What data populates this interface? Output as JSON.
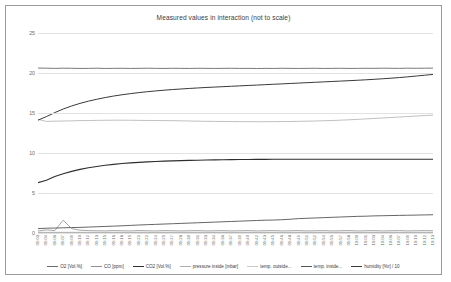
{
  "chart_data": {
    "type": "line",
    "title": "Measured values in interaction (not to scale)",
    "xlabel": "",
    "ylabel": "",
    "ylim": [
      0,
      25
    ],
    "yticks": [
      0,
      5,
      10,
      15,
      20,
      25
    ],
    "grid": true,
    "legend_position": "bottom",
    "x": [
      "09:03",
      "09:04",
      "09:06",
      "09:07",
      "09:09",
      "09:10",
      "09:12",
      "09:13",
      "09:15",
      "09:16",
      "09:18",
      "09:19",
      "09:21",
      "09:22",
      "09:24",
      "09:25",
      "09:27",
      "09:28",
      "09:30",
      "09:31",
      "09:33",
      "09:34",
      "09:36",
      "09:37",
      "09:39",
      "09:40",
      "09:42",
      "09:43",
      "09:45",
      "09:46",
      "09:48",
      "09:49",
      "09:51",
      "09:52",
      "09:54",
      "09:55",
      "09:57",
      "09:58",
      "10:00",
      "10:01",
      "10:03",
      "10:04",
      "10:06",
      "10:07",
      "10:09",
      "10:10",
      "10:12",
      "10:13"
    ],
    "series": [
      {
        "name": "O2 [Vol.%]",
        "color": "#6b6b6b",
        "width": 0.9,
        "values": [
          20.62,
          20.6,
          20.58,
          20.6,
          20.59,
          20.57,
          20.58,
          20.6,
          20.57,
          20.58,
          20.59,
          20.57,
          20.58,
          20.6,
          20.58,
          20.57,
          20.59,
          20.58,
          20.57,
          20.59,
          20.58,
          20.57,
          20.58,
          20.59,
          20.57,
          20.58,
          20.56,
          20.58,
          20.57,
          20.59,
          20.58,
          20.57,
          20.58,
          20.59,
          20.57,
          20.58,
          20.59,
          20.57,
          20.58,
          20.59,
          20.58,
          20.6,
          20.59,
          20.58,
          20.6,
          20.59,
          20.6,
          20.61
        ]
      },
      {
        "name": "CO [ppm]",
        "color": "#8f8f8f",
        "width": 0.8,
        "values": [
          0.25,
          0.4,
          0.3,
          1.6,
          0.55,
          0.35,
          0.3,
          0.28,
          0.26,
          0.3,
          0.28,
          0.26,
          0.3,
          0.28,
          0.26,
          0.3,
          0.28,
          0.26,
          0.28,
          0.3,
          0.26,
          0.28,
          0.3,
          0.26,
          0.28,
          0.3,
          0.26,
          0.28,
          0.3,
          0.26,
          0.28,
          0.3,
          0.26,
          0.28,
          0.3,
          0.26,
          0.28,
          0.3,
          0.26,
          0.28,
          0.3,
          0.26,
          0.28,
          0.3,
          0.26,
          0.28,
          0.3,
          0.28
        ]
      },
      {
        "name": "CO2 [Vol.%]",
        "color": "#2e2e2e",
        "width": 1.1,
        "values": [
          6.3,
          6.6,
          7.05,
          7.4,
          7.7,
          7.95,
          8.15,
          8.32,
          8.46,
          8.58,
          8.68,
          8.76,
          8.83,
          8.89,
          8.94,
          8.98,
          9.02,
          9.05,
          9.08,
          9.1,
          9.12,
          9.14,
          9.15,
          9.17,
          9.18,
          9.19,
          9.2,
          9.2,
          9.21,
          9.21,
          9.22,
          9.22,
          9.22,
          9.22,
          9.22,
          9.22,
          9.22,
          9.22,
          9.22,
          9.22,
          9.22,
          9.22,
          9.22,
          9.22,
          9.22,
          9.22,
          9.22,
          9.22
        ]
      },
      {
        "name": "pressure inside [mbar]",
        "color": "#b0b0b0",
        "width": 0.8,
        "values": [
          14.2,
          13.95,
          13.98,
          14.0,
          14.02,
          14.05,
          14.06,
          14.08,
          14.09,
          14.1,
          14.1,
          14.09,
          14.08,
          14.07,
          14.06,
          14.05,
          14.04,
          14.02,
          14.0,
          13.98,
          13.96,
          13.95,
          13.94,
          13.93,
          13.92,
          13.92,
          13.91,
          13.91,
          13.92,
          13.93,
          13.94,
          13.96,
          13.98,
          14.0,
          14.03,
          14.06,
          14.1,
          14.15,
          14.2,
          14.26,
          14.32,
          14.38,
          14.44,
          14.5,
          14.56,
          14.62,
          14.68,
          14.74
        ]
      },
      {
        "name": "temp. outside...",
        "color": "#c9c9c9",
        "width": 0.8,
        "values": [
          0.1,
          0.1,
          0.1,
          0.1,
          0.1,
          0.1,
          0.1,
          0.1,
          0.1,
          0.1,
          0.1,
          0.1,
          0.1,
          0.1,
          0.1,
          0.1,
          0.1,
          0.1,
          0.1,
          0.1,
          0.1,
          0.1,
          0.1,
          0.1,
          0.1,
          0.1,
          0.1,
          0.1,
          0.1,
          0.1,
          0.1,
          0.1,
          0.1,
          0.1,
          0.1,
          0.1,
          0.1,
          0.1,
          0.1,
          0.1,
          0.1,
          0.1,
          0.1,
          0.1,
          0.1,
          0.1,
          0.1,
          0.1
        ]
      },
      {
        "name": "temp. inside...",
        "color": "#555555",
        "width": 0.9,
        "values": [
          0.55,
          0.6,
          0.62,
          0.65,
          0.68,
          0.7,
          0.74,
          0.78,
          0.82,
          0.86,
          0.9,
          0.95,
          1.0,
          1.04,
          1.08,
          1.12,
          1.16,
          1.2,
          1.24,
          1.28,
          1.32,
          1.36,
          1.4,
          1.44,
          1.48,
          1.52,
          1.56,
          1.6,
          1.62,
          1.66,
          1.72,
          1.8,
          1.84,
          1.88,
          1.92,
          1.96,
          2.0,
          2.04,
          2.08,
          2.1,
          2.14,
          2.16,
          2.18,
          2.2,
          2.22,
          2.24,
          2.26,
          2.28
        ]
      },
      {
        "name": "humidity [%r] / 10",
        "color": "#3a3a3a",
        "width": 1.0,
        "values": [
          14.1,
          14.55,
          15.05,
          15.5,
          15.88,
          16.2,
          16.48,
          16.72,
          16.93,
          17.12,
          17.28,
          17.42,
          17.55,
          17.66,
          17.76,
          17.85,
          17.93,
          18.0,
          18.07,
          18.13,
          18.19,
          18.24,
          18.29,
          18.34,
          18.39,
          18.44,
          18.49,
          18.54,
          18.59,
          18.64,
          18.69,
          18.74,
          18.79,
          18.84,
          18.89,
          18.94,
          18.99,
          19.04,
          19.09,
          19.15,
          19.21,
          19.28,
          19.35,
          19.43,
          19.52,
          19.62,
          19.72,
          19.82
        ]
      }
    ]
  }
}
